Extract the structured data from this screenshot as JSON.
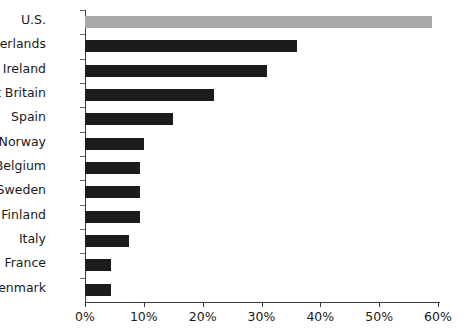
{
  "chart_data": {
    "type": "bar",
    "orientation": "horizontal",
    "title": "",
    "xlabel": "",
    "ylabel": "",
    "xlim": [
      0,
      60
    ],
    "xticks": [
      0,
      10,
      20,
      30,
      40,
      50,
      60
    ],
    "xtick_labels": [
      "0%",
      "10%",
      "20%",
      "30%",
      "40%",
      "50%",
      "60%"
    ],
    "grid": false,
    "legend": "none",
    "categories": [
      "U.S.",
      "Netherlands",
      "R of Ireland",
      "Great Britain",
      "Spain",
      "Norway",
      "Belgium",
      "Sweden",
      "Finland",
      "Italy",
      "France",
      "Denmark"
    ],
    "values": [
      59,
      36,
      31,
      22,
      15,
      10,
      9.3,
      9.3,
      9.3,
      7.5,
      4.4,
      4.4
    ],
    "value_unit": "%",
    "highlight_category": "U.S.",
    "colors": {
      "bar": "#1c1c1c",
      "highlight_bar": "#a8a8a8",
      "axis": "#3c3c3c",
      "text": "#1a1a1a",
      "background": "#ffffff"
    }
  }
}
